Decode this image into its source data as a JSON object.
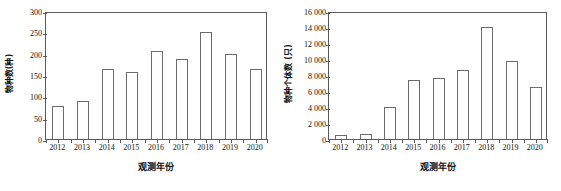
{
  "chart_data": [
    {
      "type": "bar",
      "panel": "left",
      "title": "",
      "xlabel": "观测年份",
      "ylabel": "物种数(种)",
      "categories": [
        "2012",
        "2013",
        "2014",
        "2015",
        "2016",
        "2017",
        "2018",
        "2019",
        "2020"
      ],
      "values": [
        78,
        90,
        165,
        157,
        206,
        187,
        250,
        199,
        165
      ],
      "ylim": [
        0,
        300
      ],
      "ytick_values": [
        0,
        50,
        100,
        150,
        200,
        250,
        300
      ],
      "ytick_labels": [
        "0",
        "50",
        "100",
        "150",
        "200",
        "250",
        "300"
      ],
      "grid": false,
      "legend": "none",
      "bar_fill": "#ffffff",
      "bar_edge": "#6b6b6b",
      "axis_color": "#5a5a5a"
    },
    {
      "type": "bar",
      "panel": "right",
      "title": "",
      "xlabel": "观测年份",
      "ylabel": "物种个体数 (只)",
      "categories": [
        "2012",
        "2013",
        "2014",
        "2015",
        "2016",
        "2017",
        "2018",
        "2019",
        "2020"
      ],
      "values": [
        550,
        680,
        4000,
        7400,
        7650,
        8600,
        14050,
        9800,
        6450
      ],
      "ylim": [
        0,
        16000
      ],
      "ytick_values": [
        0,
        2000,
        4000,
        6000,
        8000,
        10000,
        12000,
        14000,
        16000
      ],
      "ytick_labels": [
        "0",
        "2 000",
        "4 000",
        "6 000",
        "8 000",
        "10 000",
        "12 000",
        "14 000",
        "16 000"
      ],
      "grid": false,
      "legend": "none",
      "bar_fill": "#ffffff",
      "bar_edge": "#6b6b6b",
      "axis_color": "#5a5a5a"
    }
  ]
}
